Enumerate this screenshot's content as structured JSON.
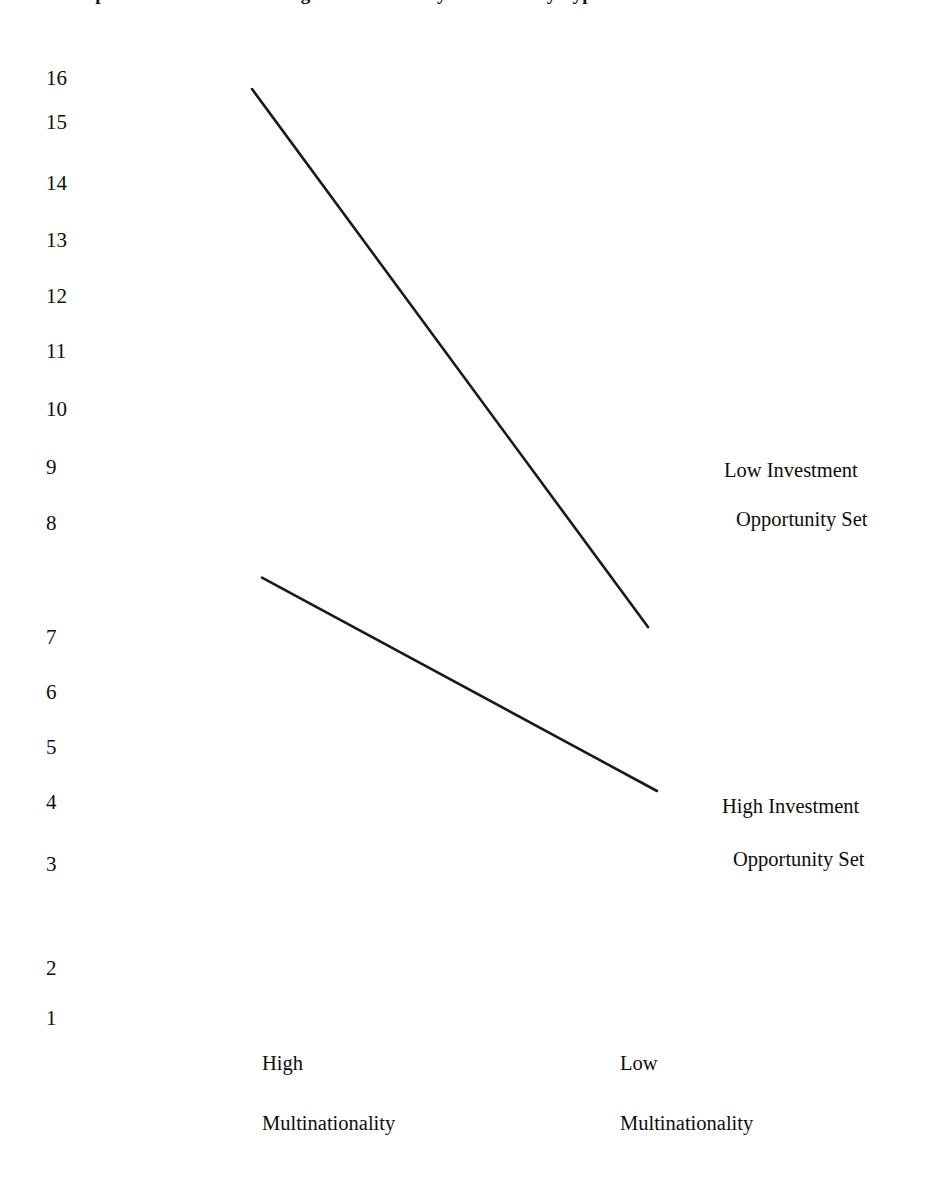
{
  "chart_data": {
    "type": "line",
    "title": "Graph 1: Performance Change in Profitability Measures by Type",
    "xlabel": "",
    "ylabel": "",
    "categories": [
      "High Multinationality",
      "Low Multinationality"
    ],
    "x_tick_labels": [
      {
        "line1": "High",
        "line2": "Multinationality"
      },
      {
        "line1": "Low",
        "line2": "Multinationality"
      }
    ],
    "y_tick_labels": [
      "16",
      "15",
      "14",
      "13",
      "12",
      "11",
      "10",
      "9",
      "8",
      "7",
      "6",
      "5",
      "4",
      "3",
      "2",
      "1"
    ],
    "ylim": [
      1,
      16
    ],
    "grid": false,
    "legend_position": "right-inline",
    "series": [
      {
        "name": "Low Investment Opportunity Set",
        "label_line1": "Low Investment",
        "label_line2": "Opportunity Set",
        "values": [
          15.7,
          7.0
        ],
        "color": "#1a1a1a"
      },
      {
        "name": "High Investment Opportunity Set",
        "label_line1": "High Investment",
        "label_line2": "Opportunity Set",
        "values": [
          7.8,
          4.35
        ],
        "color": "#1a1a1a"
      }
    ],
    "annotations": []
  },
  "figure": {
    "background_color": "#ffffff",
    "line_color": "#1a1a1a",
    "text_color": "#0d0d0d"
  }
}
